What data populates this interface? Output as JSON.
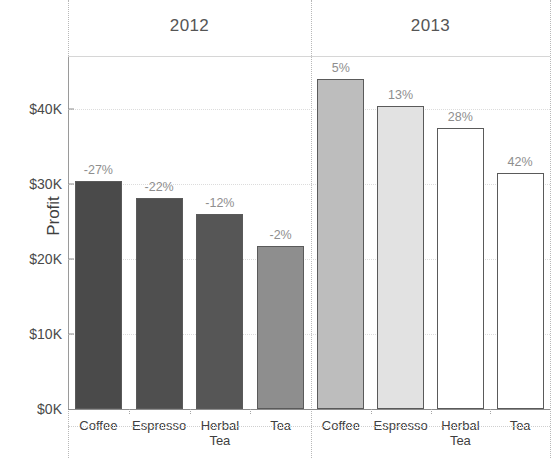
{
  "chart_data": {
    "type": "bar",
    "title": "",
    "xlabel": "",
    "ylabel": "Profit",
    "ylim": [
      0,
      47000
    ],
    "grid": true,
    "legend": "none",
    "ytick_labels": [
      "$0K",
      "$10K",
      "$20K",
      "$30K",
      "$40K"
    ],
    "ytick_values": [
      0,
      10000,
      20000,
      30000,
      40000
    ],
    "panels": [
      {
        "name": "2012",
        "categories": [
          "Coffee",
          "Espresso",
          "Herbal\nTea",
          "Tea"
        ],
        "values": [
          30500,
          28200,
          26000,
          21800
        ],
        "annotations": [
          "-27%",
          "-22%",
          "-12%",
          "-2%"
        ],
        "fills": [
          "#4a4a4a",
          "#4f4f4f",
          "#565656",
          "#8e8e8e"
        ]
      },
      {
        "name": "2013",
        "categories": [
          "Coffee",
          "Espresso",
          "Herbal\nTea",
          "Tea"
        ],
        "values": [
          44000,
          40500,
          37500,
          31500
        ],
        "annotations": [
          "5%",
          "13%",
          "28%",
          "42%"
        ],
        "fills": [
          "#bdbdbd",
          "#e2e2e2",
          "#ffffff",
          "#ffffff"
        ]
      }
    ]
  },
  "axis": {
    "y_title": "Profit"
  },
  "colors": {
    "axis_line": "#8d8d8d",
    "grid_line": "#dcdcdc",
    "separator": "#b8b8b8",
    "annotation_text": "#8e8e8e",
    "label_text": "#3f3f3f",
    "bar_outline": "#5a5a5a"
  }
}
